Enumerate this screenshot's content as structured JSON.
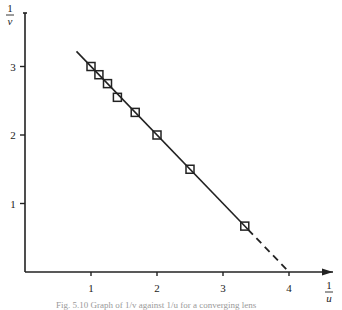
{
  "chart_data": {
    "type": "scatter",
    "title": "",
    "xlabel": "1/u",
    "ylabel": "1/v",
    "xlim": [
      0,
      4.6
    ],
    "ylim": [
      0,
      3.8
    ],
    "x_ticks": [
      1,
      2,
      3,
      4
    ],
    "y_ticks": [
      1,
      2,
      3
    ],
    "grid": false,
    "legend": null,
    "series": [
      {
        "name": "measurements",
        "marker": "square",
        "points": [
          {
            "x": 1.0,
            "y": 3.0
          },
          {
            "x": 1.12,
            "y": 2.88
          },
          {
            "x": 1.25,
            "y": 2.75
          },
          {
            "x": 1.4,
            "y": 2.55
          },
          {
            "x": 1.67,
            "y": 2.33
          },
          {
            "x": 2.0,
            "y": 2.0
          },
          {
            "x": 2.5,
            "y": 1.5
          },
          {
            "x": 3.33,
            "y": 0.67
          }
        ]
      }
    ],
    "fit_line": {
      "solid": {
        "x0": 0.78,
        "y0": 3.22,
        "x1": 3.38,
        "y1": 0.62
      },
      "dashed_extrapolation": {
        "x0": 3.38,
        "y0": 0.62,
        "x1": 4.0,
        "y1": 0.0
      },
      "x_intercept": 4.0
    },
    "annotations": []
  },
  "axes": {
    "x_label_num": "1",
    "x_label_den": "u",
    "y_label_num": "1",
    "y_label_den": "v",
    "x_tick_labels": [
      "1",
      "2",
      "3",
      "4"
    ],
    "y_tick_labels": [
      "1",
      "2",
      "3"
    ]
  },
  "caption": "Fig. 5.10  Graph of 1/v against 1/u for a converging lens"
}
